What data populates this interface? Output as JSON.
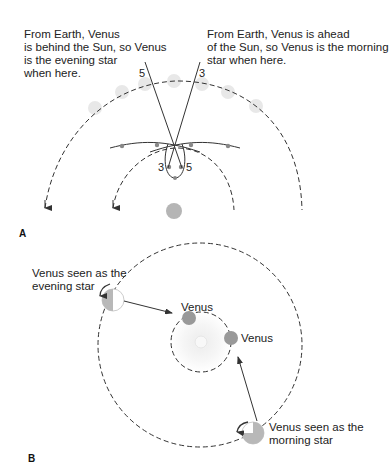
{
  "panel_a": {
    "label": "A",
    "text_left": "From Earth, Venus\nis behind the Sun, so Venus\nis the evening star\nwhen here.",
    "text_right": "From Earth, Venus is ahead\nof the Sun, so Venus is the morning\nstar when here.",
    "sight_line_labels": {
      "left_top": "5",
      "right_top": "3",
      "loop_left": "3",
      "loop_right": "5"
    }
  },
  "panel_b": {
    "label": "B",
    "evening_label": "Venus seen as the\nevening star",
    "morning_label": "Venus seen as the\nmorning star",
    "venus_top": "Venus",
    "venus_right": "Venus"
  },
  "colors": {
    "line": "#333333",
    "venus_gray": "#9a9a9a",
    "sun_gray": "#bdbdbd",
    "faint_gray": "#e6e6e6"
  }
}
